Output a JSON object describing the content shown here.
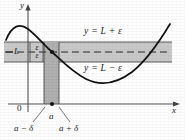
{
  "figure": {
    "kind": "epsilon-delta limit diagram",
    "axes": {
      "y_label": "y",
      "x_label": "x",
      "origin_label": "0"
    },
    "bands": {
      "upper_line_label": "y = L + ε",
      "lower_line_label": "y = L − ε",
      "center_value_label": "L",
      "epsilon_upper": "ε",
      "epsilon_lower": "ε"
    },
    "xticks": {
      "center": "a",
      "left": "a − δ",
      "right": "a + δ"
    },
    "colors": {
      "band_fill": "#c9c9c9",
      "strip_fill": "#b4b4b4",
      "curve": "#111111",
      "axis": "#555555",
      "dashed": "#333333",
      "page": "#ffffff"
    },
    "geometry": {
      "band_top_y": 42,
      "band_bottom_y": 62,
      "band_center_y": 52,
      "band_left_x": 4,
      "band_right_x": 172,
      "strip_left_x": 44,
      "strip_right_x": 59,
      "strip_top_y": 42,
      "strip_bottom_y": 104,
      "y_axis_x": 28,
      "x_axis_y": 104,
      "a_x": 52,
      "point_on_curve_y": 52
    }
  }
}
